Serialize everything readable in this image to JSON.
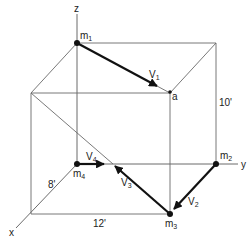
{
  "diagram": {
    "axes": {
      "x": "x",
      "y": "y",
      "z": "z"
    },
    "points": {
      "m1": {
        "label": "m",
        "sub": "1"
      },
      "m2": {
        "label": "m",
        "sub": "2"
      },
      "m3": {
        "label": "m",
        "sub": "3"
      },
      "m4": {
        "label": "m",
        "sub": "4"
      },
      "a": {
        "label": "a"
      }
    },
    "vectors": {
      "v1": {
        "label": "V",
        "sub": "1"
      },
      "v2": {
        "label": "V",
        "sub": "2"
      },
      "v3": {
        "label": "V",
        "sub": "3"
      },
      "v4": {
        "label": "V",
        "sub": "4"
      }
    },
    "dimensions": {
      "height": "10'",
      "depth": "8'",
      "width": "12'"
    },
    "colors": {
      "line": "#6a6a6a",
      "vector": "#111111",
      "background": "#ffffff"
    }
  }
}
